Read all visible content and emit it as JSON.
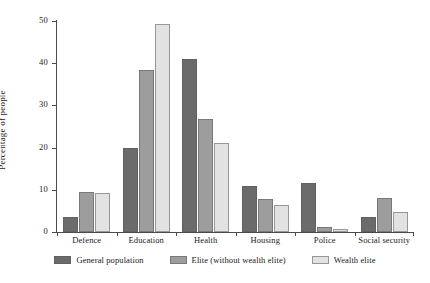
{
  "chart_data": {
    "type": "bar",
    "title": "",
    "xlabel": "",
    "ylabel": "Percentage of people",
    "ylim": [
      0,
      50
    ],
    "yticks": [
      0,
      10,
      20,
      30,
      40,
      50
    ],
    "grid": false,
    "legend_position": "bottom",
    "categories": [
      "Defence",
      "Education",
      "Health",
      "Housing",
      "Police",
      "Social security"
    ],
    "series": [
      {
        "name": "General population",
        "color": "#6b6b6b",
        "values": [
          3.6,
          20.0,
          41.0,
          10.8,
          11.5,
          3.6
        ]
      },
      {
        "name": "Elite (without wealth elite)",
        "color": "#9d9d9d",
        "values": [
          9.4,
          38.3,
          26.8,
          7.8,
          1.3,
          8.1
        ]
      },
      {
        "name": "Wealth elite",
        "color": "#e2e2e2",
        "values": [
          9.3,
          49.3,
          21.0,
          6.3,
          0.8,
          4.8
        ]
      }
    ]
  }
}
